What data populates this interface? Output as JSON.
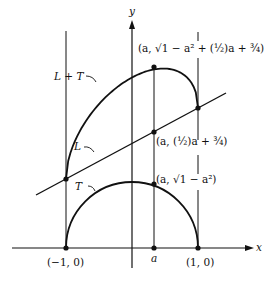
{
  "figure": {
    "axes": {
      "x_label": "x",
      "y_label": "y"
    },
    "curves": {
      "sum_label": "L + T",
      "line_label": "L",
      "semicircle_label": "T"
    },
    "points": {
      "left": "(−1, 0)",
      "right": "(1, 0)",
      "a": "a",
      "top_point": "(a, √1 − a² + (½)a + ¾)",
      "line_point": "(a, (½)a + ¾)",
      "semi_point": "(a, √1 − a²)"
    }
  }
}
